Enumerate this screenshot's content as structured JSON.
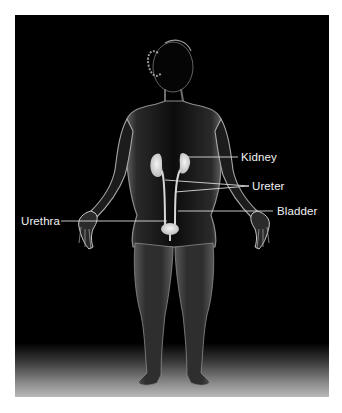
{
  "diagram": {
    "colors": {
      "background": "#000000",
      "frame_border": "#ffffff",
      "label_text": "#f2f2f2",
      "leader_line": "#d9d9d9",
      "organ_fill": "#e6e6e6"
    },
    "labels": [
      {
        "id": "kidney",
        "text": "Kidney",
        "side": "right"
      },
      {
        "id": "ureter",
        "text": "Ureter",
        "side": "right"
      },
      {
        "id": "bladder",
        "text": "Bladder",
        "side": "right"
      },
      {
        "id": "urethra",
        "text": "Urethra",
        "side": "left"
      }
    ]
  }
}
